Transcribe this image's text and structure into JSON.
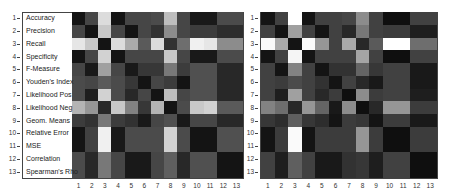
{
  "chart_data": [
    {
      "type": "heatmap",
      "title": "",
      "xlabel": "",
      "ylabel": "",
      "colormap": "gray",
      "x_ticks": [
        "1",
        "2",
        "3",
        "4",
        "5",
        "6",
        "7",
        "8",
        "9",
        "10",
        "11",
        "12",
        "13"
      ],
      "y_ticks": [
        "1",
        "2",
        "3",
        "4",
        "5",
        "6",
        "7",
        "8",
        "9",
        "10",
        "11",
        "12",
        "13"
      ],
      "row_labels": [
        "Accuracy",
        "Precision",
        "Recall",
        "Specificity",
        "F-Measure",
        "Youden's Index",
        "Likelihood Pos",
        "Likelihood Neg",
        "Geom. Means",
        "Relative Error",
        "MSE",
        "Correlation",
        "Spearman's Rho"
      ],
      "values": [
        [
          20,
          70,
          220,
          20,
          70,
          70,
          75,
          190,
          70,
          25,
          25,
          75,
          75
        ],
        [
          70,
          20,
          200,
          70,
          20,
          70,
          50,
          140,
          70,
          60,
          60,
          45,
          45
        ],
        [
          230,
          200,
          20,
          220,
          170,
          90,
          220,
          50,
          110,
          240,
          230,
          140,
          140
        ],
        [
          20,
          70,
          210,
          20,
          70,
          70,
          70,
          200,
          70,
          25,
          25,
          75,
          75
        ],
        [
          70,
          25,
          160,
          70,
          25,
          55,
          55,
          120,
          60,
          80,
          80,
          40,
          40
        ],
        [
          75,
          70,
          90,
          75,
          55,
          20,
          70,
          60,
          20,
          80,
          80,
          40,
          40
        ],
        [
          75,
          30,
          210,
          75,
          40,
          70,
          20,
          190,
          70,
          80,
          80,
          40,
          40
        ],
        [
          180,
          150,
          40,
          200,
          130,
          55,
          180,
          20,
          75,
          200,
          210,
          90,
          90
        ],
        [
          60,
          50,
          120,
          60,
          50,
          25,
          70,
          80,
          25,
          70,
          70,
          40,
          40
        ],
        [
          20,
          65,
          240,
          25,
          75,
          75,
          75,
          210,
          75,
          20,
          20,
          80,
          80
        ],
        [
          20,
          65,
          240,
          25,
          75,
          75,
          75,
          210,
          75,
          20,
          20,
          80,
          80
        ],
        [
          75,
          40,
          120,
          70,
          25,
          25,
          70,
          95,
          40,
          80,
          80,
          20,
          20
        ],
        [
          75,
          40,
          120,
          70,
          25,
          25,
          70,
          95,
          40,
          80,
          80,
          20,
          20
        ]
      ]
    },
    {
      "type": "heatmap",
      "title": "",
      "xlabel": "",
      "ylabel": "",
      "colormap": "gray",
      "x_ticks": [
        "1",
        "2",
        "3",
        "4",
        "5",
        "6",
        "7",
        "8",
        "9",
        "10",
        "11",
        "12",
        "13"
      ],
      "y_ticks": [
        "1",
        "2",
        "3",
        "4",
        "5",
        "6",
        "7",
        "8",
        "9",
        "10",
        "11",
        "12",
        "13"
      ],
      "values": [
        [
          20,
          65,
          255,
          20,
          65,
          65,
          70,
          140,
          65,
          15,
          15,
          65,
          65
        ],
        [
          65,
          20,
          160,
          65,
          20,
          65,
          40,
          120,
          65,
          60,
          60,
          30,
          30
        ],
        [
          250,
          170,
          20,
          250,
          150,
          65,
          170,
          40,
          90,
          255,
          255,
          110,
          110
        ],
        [
          20,
          65,
          245,
          20,
          65,
          65,
          65,
          165,
          65,
          15,
          15,
          65,
          65
        ],
        [
          65,
          20,
          130,
          65,
          20,
          50,
          50,
          100,
          55,
          65,
          65,
          25,
          25
        ],
        [
          65,
          60,
          75,
          65,
          50,
          20,
          65,
          40,
          25,
          65,
          65,
          25,
          25
        ],
        [
          65,
          30,
          160,
          65,
          40,
          60,
          15,
          140,
          60,
          65,
          65,
          30,
          30
        ],
        [
          130,
          110,
          40,
          150,
          100,
          25,
          140,
          15,
          40,
          150,
          150,
          60,
          60
        ],
        [
          55,
          45,
          95,
          55,
          45,
          20,
          60,
          55,
          20,
          60,
          60,
          25,
          25
        ],
        [
          20,
          60,
          250,
          20,
          60,
          60,
          60,
          150,
          60,
          15,
          15,
          60,
          60
        ],
        [
          20,
          60,
          250,
          20,
          60,
          60,
          60,
          150,
          60,
          15,
          15,
          60,
          60
        ],
        [
          65,
          30,
          95,
          65,
          25,
          25,
          50,
          55,
          30,
          65,
          65,
          15,
          15
        ],
        [
          65,
          30,
          95,
          65,
          25,
          25,
          50,
          55,
          30,
          65,
          65,
          15,
          15
        ]
      ]
    }
  ]
}
